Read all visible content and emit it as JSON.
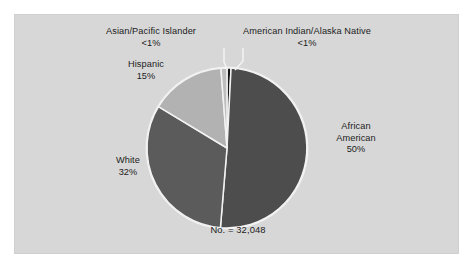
{
  "figure": {
    "background_color": "#ffffff",
    "panel_color": "#d7d7d7",
    "panel_border_color": "#cfcfcf",
    "divider_color": "#f2f2f2",
    "text_color": "#1b1b1b"
  },
  "labels": {
    "asian": "Asian/Pacific Islander\n<1%",
    "american_indian": "American Indian/Alaska Native\n<1%",
    "hispanic": "Hispanic\n15%",
    "white": "White\n32%",
    "african_american": "African\nAmerican\n50%",
    "total": "No. = 32,048"
  },
  "chart_data": {
    "type": "pie",
    "title": "",
    "subtitle": "",
    "xlabel": "",
    "ylabel": "",
    "annotations": [
      "No. = 32,048"
    ],
    "total": 32048,
    "total_label": "No. = 32,048",
    "legend": "none",
    "grid": false,
    "start_angle_deg": 0,
    "direction": "clockwise",
    "slices": [
      {
        "name": "American Indian/Alaska Native",
        "label": "American Indian/Alaska Native",
        "value_label": "<1%",
        "percent": 0.8,
        "color": "#141414"
      },
      {
        "name": "African American",
        "label": "African American",
        "value_label": "50%",
        "percent": 50,
        "color": "#4d4d4d"
      },
      {
        "name": "White",
        "label": "White",
        "value_label": "32%",
        "percent": 32,
        "color": "#5b5b5b"
      },
      {
        "name": "Hispanic",
        "label": "Hispanic",
        "value_label": "15%",
        "percent": 15,
        "color": "#b2b2b2"
      },
      {
        "name": "Asian/Pacific Islander",
        "label": "Asian/Pacific Islander",
        "value_label": "<1%",
        "percent": 1.2,
        "color": "#bdbdbd"
      }
    ]
  }
}
